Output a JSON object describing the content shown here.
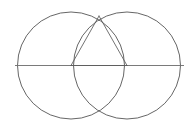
{
  "figure": {
    "background_color": "#ffffff",
    "canvas": {
      "width": 195,
      "height": 130
    }
  },
  "style": {
    "circle_stroke_color": "#4a4a4a",
    "circle_stroke_width": 0.85,
    "axis_stroke_color": "#6b6b6b",
    "axis_stroke_width": 0.9,
    "triangle_stroke_color": "#5a5a5a",
    "triangle_stroke_width": 0.85
  },
  "chart_data": {
    "type": "scatter",
    "xlabel": "",
    "ylabel": "",
    "xlim": [
      0,
      195
    ],
    "ylim": [
      0,
      130
    ],
    "grid": false,
    "legend": "none",
    "circles": [
      {
        "name": "left-circle",
        "cx": 71,
        "cy": 65.5,
        "r": 53.5
      },
      {
        "name": "right-circle",
        "cx": 127,
        "cy": 65.5,
        "r": 53.5
      }
    ],
    "points": [
      {
        "name": "left-center",
        "x": 71,
        "y": 65.5
      },
      {
        "name": "right-center",
        "x": 127,
        "y": 65.5
      },
      {
        "name": "upper-intersection",
        "x": 99,
        "y": 16
      },
      {
        "name": "lower-intersection",
        "x": 99,
        "y": 115
      },
      {
        "name": "left-extent",
        "x": 15,
        "y": 65.5
      },
      {
        "name": "right-extent",
        "x": 184,
        "y": 65.5
      }
    ],
    "segments": [
      {
        "name": "horizontal-diameter",
        "x1": 15,
        "y1": 65.5,
        "x2": 184,
        "y2": 65.5
      },
      {
        "name": "triangle-left-leg",
        "x1": 99,
        "y1": 16,
        "x2": 71,
        "y2": 65.5
      },
      {
        "name": "triangle-right-leg",
        "x1": 99,
        "y1": 16,
        "x2": 127,
        "y2": 65.5
      },
      {
        "name": "triangle-base",
        "x1": 71,
        "y1": 65.5,
        "x2": 127,
        "y2": 65.5
      }
    ]
  }
}
